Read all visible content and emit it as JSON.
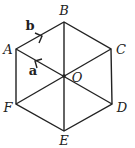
{
  "diagram": {
    "type": "regular hexagon with center",
    "colors": {
      "stroke": "#222222",
      "background": "#ffffff"
    },
    "vertices": [
      {
        "id": "A",
        "label": "A",
        "x": 16,
        "y": 49,
        "lx": 8,
        "ly": 54
      },
      {
        "id": "B",
        "label": "B",
        "x": 64,
        "y": 22,
        "lx": 64,
        "ly": 15
      },
      {
        "id": "C",
        "label": "C",
        "x": 111,
        "y": 49,
        "lx": 121,
        "ly": 54
      },
      {
        "id": "D",
        "label": "D",
        "x": 112,
        "y": 104,
        "lx": 122,
        "ly": 112
      },
      {
        "id": "E",
        "label": "E",
        "x": 64,
        "y": 131,
        "lx": 64,
        "ly": 145
      },
      {
        "id": "F",
        "label": "F",
        "x": 16,
        "y": 104,
        "lx": 8,
        "ly": 112
      }
    ],
    "center": {
      "id": "O",
      "label": "O",
      "x": 64,
      "y": 76,
      "lx": 77,
      "ly": 82
    },
    "vectors": [
      {
        "name": "a",
        "label": "a",
        "from": "O",
        "to": "A"
      },
      {
        "name": "b",
        "label": "b",
        "from": "A",
        "to": "B"
      }
    ]
  }
}
